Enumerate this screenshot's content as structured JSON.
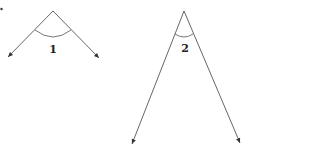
{
  "diagram": {
    "colors": {
      "line": "#555555",
      "arc": "#666666",
      "label": "#222222",
      "background": "#ffffff"
    },
    "corner_mark": {
      "x": 1.5,
      "y": 9
    },
    "angles": [
      {
        "id": "angle-1",
        "label": "1",
        "vertex": [
          53,
          11
        ],
        "ray_left_end": [
          8,
          57
        ],
        "ray_right_end": [
          99,
          58
        ],
        "arc_path": "M 35 30 Q 53 44 71 30",
        "label_pos": [
          53,
          53
        ]
      },
      {
        "id": "angle-2",
        "label": "2",
        "vertex": [
          184,
          11
        ],
        "ray_left_end": [
          132,
          144
        ],
        "ray_right_end": [
          240,
          143
        ],
        "arc_path": "M 175 34 Q 184 40 193 34",
        "label_pos": [
          185,
          52
        ]
      }
    ]
  }
}
